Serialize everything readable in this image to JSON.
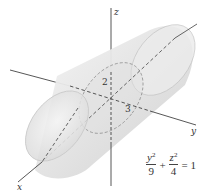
{
  "figure": {
    "type": "3d-surface-sketch",
    "surface": "elliptic cylinder along x-axis",
    "axes": {
      "x": {
        "label": "x"
      },
      "y": {
        "label": "y"
      },
      "z": {
        "label": "z"
      }
    },
    "annotations": {
      "z_semi_axis": "2",
      "y_semi_axis": "3"
    },
    "equation": {
      "term1_num_var": "y",
      "term1_num_exp": "2",
      "term1_den": "9",
      "plus": "+",
      "term2_num_var": "z",
      "term2_num_exp": "2",
      "term2_den": "4",
      "equals": "=",
      "rhs": "1"
    },
    "colors": {
      "surface_fill": "#e6e6e6",
      "surface_edge": "#b5b5b5",
      "axis": "#444444"
    }
  }
}
